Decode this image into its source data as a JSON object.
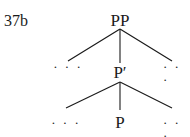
{
  "example_number": "37b",
  "tree": {
    "root": {
      "label": "PP"
    },
    "level1": {
      "left": "· · ·",
      "middle": "P′",
      "right": "· · ·"
    },
    "level2": {
      "left": "· · ·",
      "middle": "P",
      "right": "· · ·"
    }
  },
  "colors": {
    "ink": "#1a1a1a",
    "background": "#ffffff"
  }
}
